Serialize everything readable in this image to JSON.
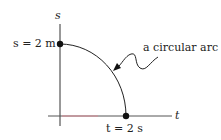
{
  "diagram": {
    "type": "position-time graph",
    "axes": {
      "vertical_label": "s",
      "horizontal_label": "t"
    },
    "points": [
      {
        "label": "s = 2 m",
        "meaning": "start position on s-axis"
      },
      {
        "label": "t = 2 s",
        "meaning": "end time on t-axis"
      }
    ],
    "annotation": "a circular arc",
    "colors": {
      "axis": "#333333",
      "axis_highlight": "#d98a94",
      "curve": "#222222",
      "dot": "#111111"
    }
  }
}
